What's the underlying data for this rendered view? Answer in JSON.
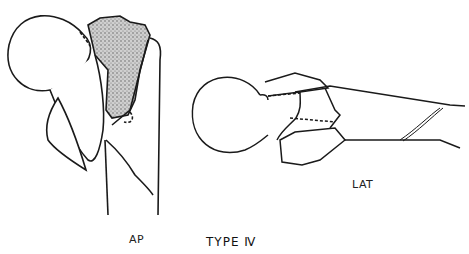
{
  "figure": {
    "title": "TYPE Ⅳ",
    "views": [
      {
        "id": "ap",
        "label": "AP"
      },
      {
        "id": "lat",
        "label": "LAT"
      }
    ]
  },
  "colors": {
    "ink": "#1a1a1a",
    "stipple": "#9a9a9a",
    "background": "#ffffff"
  }
}
